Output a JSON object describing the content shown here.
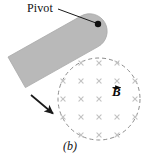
{
  "figure": {
    "caption": "(b)",
    "background_color": "#ffffff",
    "width": 142,
    "height": 160
  },
  "labels": {
    "pivot": "Pivot",
    "field": "B",
    "field_symbol_name": "vector-B"
  },
  "rod": {
    "name": "pivoting-bar",
    "fill_color": "#b9b9b9",
    "edge_color": "#a8a8a8",
    "angle_deg": 29,
    "length": 100,
    "thickness": 34
  },
  "pivot_point": {
    "x": 98,
    "y": 24,
    "radius": 3.2,
    "color": "#111111"
  },
  "leader_line": {
    "from_x": 58,
    "from_y": 9,
    "to_x": 96,
    "to_y": 23,
    "color": "#1a1a1a"
  },
  "field_region": {
    "name": "magnetic-field-circle",
    "center_x": 99,
    "center_y": 99,
    "radius": 41,
    "stroke_color": "#8d8d8d",
    "dash": "4 3",
    "into_page_marker": "x",
    "marker_color": "#c2c2c2",
    "marker_spacing": 18,
    "marker_size": 4.2,
    "markers": [
      {
        "x": 81,
        "y": 63
      },
      {
        "x": 99,
        "y": 63
      },
      {
        "x": 117,
        "y": 63
      },
      {
        "x": 63,
        "y": 81
      },
      {
        "x": 81,
        "y": 81
      },
      {
        "x": 99,
        "y": 81
      },
      {
        "x": 117,
        "y": 81
      },
      {
        "x": 135,
        "y": 81
      },
      {
        "x": 63,
        "y": 99
      },
      {
        "x": 81,
        "y": 99
      },
      {
        "x": 99,
        "y": 99
      },
      {
        "x": 135,
        "y": 99
      },
      {
        "x": 63,
        "y": 117
      },
      {
        "x": 81,
        "y": 117
      },
      {
        "x": 99,
        "y": 117
      },
      {
        "x": 117,
        "y": 117
      },
      {
        "x": 135,
        "y": 117
      },
      {
        "x": 81,
        "y": 135
      },
      {
        "x": 99,
        "y": 135
      },
      {
        "x": 117,
        "y": 135
      }
    ]
  },
  "motion_arrow": {
    "name": "motion-direction-arrow",
    "from_x": 31,
    "from_y": 95,
    "to_x": 56,
    "to_y": 116,
    "color": "#1a1a1a"
  }
}
